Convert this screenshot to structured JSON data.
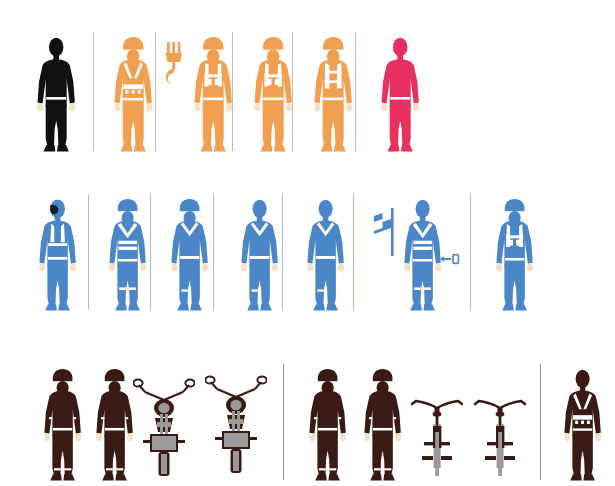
{
  "canvas": {
    "width": 615,
    "height": 486,
    "background": "#ffffff"
  },
  "palette": {
    "black": "#111111",
    "orange": "#F0A050",
    "crimson": "#E8305F",
    "blue": "#4A86C8",
    "dark_brown": "#3A1A14",
    "steel": "#9a9a9a",
    "skin_highlight": "#F3E2C8",
    "divider_warm": "#c9b9ae",
    "divider_pink": "#d9a8b4",
    "divider_cool": "#a8bed6",
    "divider_grey": "#8d8d8d"
  },
  "rows": [
    {
      "id": "row-workwear-warm",
      "name": "orange-workwear-row",
      "color_group": "orange",
      "figures": [
        {
          "name": "figure-silhouette-black",
          "color": "black",
          "label": "plain black silhouette figure",
          "variant": "plain",
          "helmet": false,
          "x": 33
        },
        {
          "name": "figure-orange-harness-vest",
          "color": "orange",
          "label": "worker with helmet and full-body harness",
          "variant": "harness",
          "helmet": true,
          "x": 110
        },
        {
          "name": "figure-orange-lifting-vest",
          "color": "orange",
          "label": "worker with helmet and high-visibility vest beside lifting hook",
          "variant": "vest-pockets",
          "helmet": true,
          "x": 190
        },
        {
          "name": "figure-orange-vest-pockets",
          "color": "orange",
          "label": "worker with helmet and pocketed vest",
          "variant": "vest-pockets",
          "helmet": true,
          "x": 250
        },
        {
          "name": "figure-orange-vest-straps",
          "color": "orange",
          "label": "worker with helmet and strapped vest",
          "variant": "vest-straps",
          "helmet": true,
          "x": 310
        },
        {
          "name": "figure-crimson-plain",
          "color": "crimson",
          "label": "plain crimson figure",
          "variant": "plain",
          "helmet": false,
          "x": 377
        }
      ],
      "dividers": [
        93,
        155,
        232,
        292,
        355
      ],
      "props": [
        {
          "name": "lifting-hook-icon",
          "label": "crane lifting hook",
          "color": "orange",
          "x": 163,
          "y": 42
        }
      ]
    },
    {
      "id": "row-workwear-cool",
      "name": "blue-workwear-row",
      "color_group": "blue",
      "figures": [
        {
          "name": "figure-blue-respirator",
          "color": "blue",
          "label": "worker wearing respirator mask and vest",
          "variant": "respirator",
          "helmet": false,
          "x": 35
        },
        {
          "name": "figure-blue-helmet-vest",
          "color": "blue",
          "label": "worker with helmet and reflective vest",
          "variant": "vest-bands",
          "helmet": true,
          "x": 105
        },
        {
          "name": "figure-blue-helmet-collar",
          "color": "blue",
          "label": "worker with helmet and collared coverall",
          "variant": "collar",
          "helmet": true,
          "x": 167
        },
        {
          "name": "figure-blue-coverall",
          "color": "blue",
          "label": "worker in plain coverall",
          "variant": "collar",
          "helmet": false,
          "x": 237
        },
        {
          "name": "figure-blue-coverall-belt",
          "color": "blue",
          "label": "worker in coverall with belt",
          "variant": "collar",
          "helmet": false,
          "x": 303
        },
        {
          "name": "figure-blue-flagger",
          "color": "blue",
          "label": "flag signaller with banner and hand tool",
          "variant": "vest-bands",
          "helmet": false,
          "x": 400
        },
        {
          "name": "figure-blue-helmet-vest-2",
          "color": "blue",
          "label": "worker with helmet and pocketed vest",
          "variant": "vest-pockets",
          "helmet": true,
          "x": 492
        }
      ],
      "dividers": [
        88,
        150,
        213,
        282,
        353,
        470
      ],
      "props": [
        {
          "name": "signal-flag-icon",
          "label": "signalling flag on pole",
          "color": "blue",
          "x": 372,
          "y": 208
        },
        {
          "name": "hand-tool-icon",
          "label": "small hand tool",
          "color": "blue",
          "x": 440,
          "y": 253
        }
      ]
    },
    {
      "id": "row-riders",
      "name": "dark-rider-row",
      "color_group": "dark_brown",
      "figures": [
        {
          "name": "figure-motorcyclist-helmeted",
          "color": "dark_brown",
          "label": "motorcyclist with full-face helmet",
          "variant": "rider-helmet",
          "helmet": true,
          "x": 40
        },
        {
          "name": "figure-motorcyclist-open-helmet",
          "color": "dark_brown",
          "label": "motorcyclist with open-face helmet",
          "variant": "rider-helmet",
          "helmet": true,
          "x": 92
        },
        {
          "name": "figure-cyclist-helmeted",
          "color": "dark_brown",
          "label": "cyclist with helmet",
          "variant": "rider-helmet",
          "helmet": true,
          "x": 305
        },
        {
          "name": "figure-cyclist-open-helmet",
          "color": "dark_brown",
          "label": "cyclist with open helmet",
          "variant": "rider-helmet",
          "helmet": true,
          "x": 360
        },
        {
          "name": "figure-harness-worker",
          "color": "dark_brown",
          "label": "worker in climbing harness",
          "variant": "harness",
          "helmet": false,
          "x": 560
        }
      ],
      "dividers": [
        283,
        540
      ],
      "props": [
        {
          "name": "motorcycle-front-icon",
          "label": "motorcycle front view",
          "color": "dark_brown",
          "x": 133,
          "y": 378
        },
        {
          "name": "motorcycle-front-icon",
          "label": "motorcycle front view",
          "color": "dark_brown",
          "x": 205,
          "y": 375
        },
        {
          "name": "bicycle-front-icon",
          "label": "bicycle front view",
          "color": "dark_brown",
          "x": 410,
          "y": 392
        },
        {
          "name": "bicycle-front-icon",
          "label": "bicycle front view",
          "color": "dark_brown",
          "x": 473,
          "y": 392
        }
      ]
    }
  ],
  "summary": {
    "title": "Pictogram grid of protective-equipment worker figures",
    "figure_count": 18,
    "row_count": 3,
    "prop_count": 7
  }
}
